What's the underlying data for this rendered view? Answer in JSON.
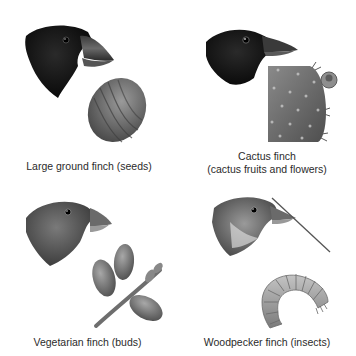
{
  "figure": {
    "panels": [
      {
        "id": "large-ground-finch",
        "caption_lines": [
          "Large ground finch (seeds)"
        ],
        "food_icon": "seed-icon",
        "bird_color": "black"
      },
      {
        "id": "cactus-finch",
        "caption_lines": [
          "Cactus finch",
          "(cactus fruits and flowers)"
        ],
        "food_icon": "cactus-pad-icon",
        "bird_color": "black"
      },
      {
        "id": "vegetarian-finch",
        "caption_lines": [
          "Vegetarian finch (buds)"
        ],
        "food_icon": "bud-branch-icon",
        "bird_color": "gray-brown"
      },
      {
        "id": "woodpecker-finch",
        "caption_lines": [
          "Woodpecker finch (insects)"
        ],
        "food_icon": "grub-icon",
        "bird_color": "gray-streaked"
      }
    ]
  }
}
